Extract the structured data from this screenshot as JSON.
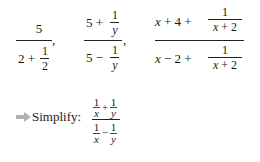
{
  "expressions": [
    {
      "numerator": "5",
      "denominator": {
        "whole": "2 +",
        "frac_num": "1",
        "frac_den": "2"
      },
      "trail": ","
    },
    {
      "numerator": {
        "whole": "5 +",
        "frac_num": "1",
        "frac_den": "y"
      },
      "denominator": {
        "whole": "5 −",
        "frac_num": "1",
        "frac_den": "y"
      },
      "trail": ","
    },
    {
      "numerator": {
        "whole_var": "x",
        "whole_rest": "+ 4 +",
        "frac_num": "1",
        "frac_den_var": "x",
        "frac_den_rest": "+ 2"
      },
      "denominator": {
        "whole_var": "x",
        "whole_rest": "− 2 +",
        "frac_num": "1",
        "frac_den_var": "x",
        "frac_den_rest": "+ 2"
      }
    }
  ],
  "prompt": {
    "arrow_color": "#b0b0b0",
    "label": "Simplify:",
    "top": {
      "a_num": "1",
      "a_den": "x",
      "op": "+",
      "b_num": "1",
      "b_den": "y"
    },
    "bottom": {
      "a_num": "1",
      "a_den": "x",
      "op": "−",
      "b_num": "1",
      "b_den": "y"
    }
  }
}
